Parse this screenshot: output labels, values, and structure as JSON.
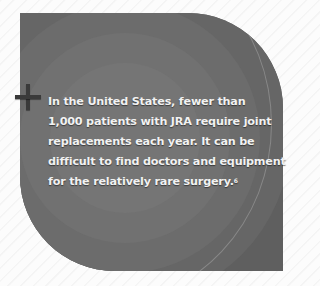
{
  "callout": {
    "lines": [
      "In the United States, fewer than",
      "1,000 patients with JRA require joint",
      "replacements each year. It can be",
      "difficult to find doctors and equipment",
      "for the relatively rare surgery."
    ],
    "footnote": "6",
    "icon": "plus-icon"
  }
}
